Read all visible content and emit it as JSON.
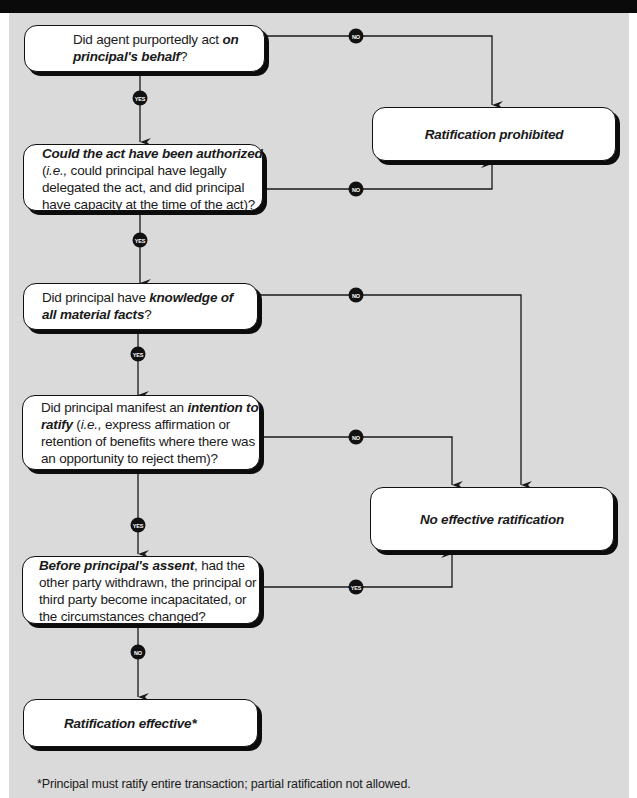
{
  "diagram": {
    "questions": [
      {
        "id": "q1",
        "parts": [
          {
            "text": "Did agent purportedly act ",
            "style": "normal"
          },
          {
            "text": "on principal's behalf",
            "style": "bold-italic"
          },
          {
            "text": "?",
            "style": "normal"
          }
        ],
        "yes_label": "YES",
        "no_label": "NO",
        "no_target": "Ratification prohibited"
      },
      {
        "id": "q2",
        "parts": [
          {
            "text": "Could the act have been authorized",
            "style": "bold-italic"
          },
          {
            "text": " (",
            "style": "normal"
          },
          {
            "text": "i.e.,",
            "style": "italic"
          },
          {
            "text": " could principal have legally delegated the act, and did principal have capacity at the time of the act)?",
            "style": "normal"
          }
        ],
        "yes_label": "YES",
        "no_label": "NO",
        "no_target": "Ratification prohibited"
      },
      {
        "id": "q3",
        "parts": [
          {
            "text": "Did principal have ",
            "style": "normal"
          },
          {
            "text": "knowledge of all material facts",
            "style": "bold-italic"
          },
          {
            "text": "?",
            "style": "normal"
          }
        ],
        "yes_label": "YES",
        "no_label": "NO",
        "no_target": "No effective ratification"
      },
      {
        "id": "q4",
        "parts": [
          {
            "text": "Did principal manifest an ",
            "style": "normal"
          },
          {
            "text": "intention to ratify",
            "style": "bold-italic"
          },
          {
            "text": " (",
            "style": "normal"
          },
          {
            "text": "i.e.,",
            "style": "italic"
          },
          {
            "text": " express affirmation or retention of benefits where there was an opportunity to reject them)?",
            "style": "normal"
          }
        ],
        "yes_label": "YES",
        "no_label": "NO",
        "no_target": "No effective ratification"
      },
      {
        "id": "q5",
        "parts": [
          {
            "text": "Before principal's assent",
            "style": "bold-italic"
          },
          {
            "text": ", had the other party withdrawn, the principal or third party become incapacitated, or the circumstances changed?",
            "style": "normal"
          }
        ],
        "yes_label": "YES",
        "no_label": "NO",
        "yes_target": "No effective ratification",
        "no_target": "Ratification effective*"
      }
    ],
    "outcomes": {
      "prohibited": "Ratification prohibited",
      "no_effect": "No effective ratification",
      "effective": "Ratification effective*"
    },
    "footnote": "*Principal must ratify entire transaction; partial ratification not allowed."
  },
  "colors": {
    "header_bar": "#0a0a0a",
    "panel_bg": "#dadada",
    "box_bg": "#ffffff",
    "line": "#1a1a1a",
    "badge_bg": "#111111",
    "badge_text": "#ffffff"
  }
}
